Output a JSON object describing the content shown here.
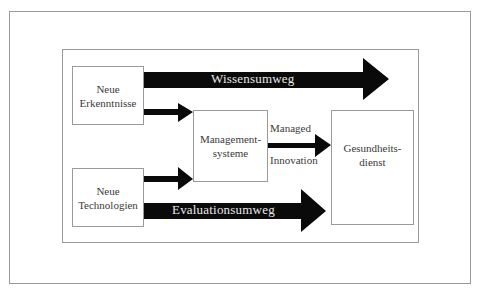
{
  "diagram": {
    "nodes": {
      "neue_erkenntnisse": {
        "line1": "Neue",
        "line2": "Erkenntnisse"
      },
      "neue_technologien": {
        "line1": "Neue",
        "line2": "Technologien"
      },
      "managementsysteme": {
        "line1": "Management-",
        "line2": "systeme"
      },
      "gesundheitsdienst": {
        "line1": "Gesundheits-",
        "line2": "dienst"
      }
    },
    "paths": {
      "wissensumweg": "Wissensumweg",
      "evaluationsumweg": "Evaluationsumweg",
      "managed_innovation_top": "Managed",
      "managed_innovation_bottom": "Innovation"
    },
    "edges": [
      {
        "from": "Neue Erkenntnisse",
        "to": "Gesundheitsdienst",
        "label": "Wissensumweg",
        "style": "wide"
      },
      {
        "from": "Neue Erkenntnisse",
        "to": "Managementsysteme",
        "label": "",
        "style": "narrow"
      },
      {
        "from": "Neue Technologien",
        "to": "Managementsysteme",
        "label": "",
        "style": "narrow"
      },
      {
        "from": "Managementsysteme",
        "to": "Gesundheitsdienst",
        "label": "Managed Innovation",
        "style": "narrow"
      },
      {
        "from": "Neue Technologien",
        "to": "Gesundheitsdienst",
        "label": "Evaluationsumweg",
        "style": "wide"
      }
    ],
    "colors": {
      "arrow": "#0a0a0a",
      "border": "#9a9a9a",
      "arrow_text": "#e8e8e8"
    }
  }
}
